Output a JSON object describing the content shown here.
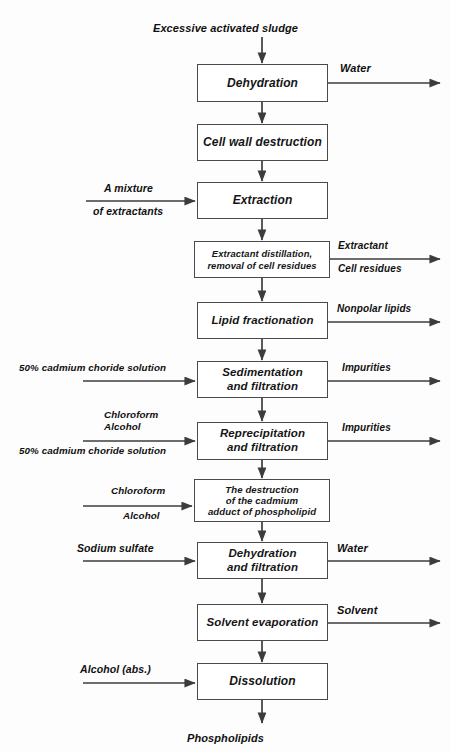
{
  "diagram": {
    "title_text": "Excessive activated sludge",
    "final_output": "Phospholipids",
    "line_color": "#3c3c3c",
    "box_border_color": "#4a4a4a",
    "text_color": "#101010",
    "background": "#fdfdfd"
  },
  "nodes": [
    {
      "id": "dehydration",
      "label": "Dehydration",
      "x": 197,
      "y": 64,
      "w": 131,
      "h": 38,
      "font": 12
    },
    {
      "id": "cell-wall",
      "label": "Cell wall destruction",
      "x": 197,
      "y": 124,
      "w": 131,
      "h": 37,
      "font": 12
    },
    {
      "id": "extraction",
      "label": "Extraction",
      "x": 197,
      "y": 182,
      "w": 131,
      "h": 37,
      "font": 12
    },
    {
      "id": "distillation",
      "label": "Extractant distillation,\nremoval of cell residues",
      "x": 194,
      "y": 241,
      "w": 136,
      "h": 37,
      "font": 9.4
    },
    {
      "id": "lipid-fraction",
      "label": "Lipid fractionation",
      "x": 197,
      "y": 302,
      "w": 131,
      "h": 37,
      "font": 11.5
    },
    {
      "id": "sedimentation",
      "label": "Sedimentation\nand filtration",
      "x": 197,
      "y": 361,
      "w": 131,
      "h": 37,
      "font": 11.5
    },
    {
      "id": "reprecipitation",
      "label": "Reprecipitation\nand filtration",
      "x": 197,
      "y": 422,
      "w": 131,
      "h": 38,
      "font": 11.5
    },
    {
      "id": "destruction",
      "label": "The destruction\nof the cadmium\nadduct of phospholipid",
      "x": 194,
      "y": 479,
      "w": 136,
      "h": 43,
      "font": 9.6
    },
    {
      "id": "dehydration-filt",
      "label": "Dehydration\nand filtration",
      "x": 197,
      "y": 542,
      "w": 131,
      "h": 37,
      "font": 11.5
    },
    {
      "id": "solvent-evap",
      "label": "Solvent evaporation",
      "x": 197,
      "y": 604,
      "w": 131,
      "h": 37,
      "font": 11.5
    },
    {
      "id": "dissolution",
      "label": "Dissolution",
      "x": 197,
      "y": 663,
      "w": 131,
      "h": 37,
      "font": 12
    }
  ],
  "inputs": [
    {
      "id": "mixture-extractants",
      "target": "extraction",
      "above": "A mixture",
      "below": "of extractants",
      "arrow_y": 201,
      "arrow_x1": 86,
      "arrow_x2": 195,
      "above_x": 104,
      "above_y": 182,
      "below_x": 93,
      "below_y": 205,
      "font": 10.5
    },
    {
      "id": "cadmium-chloride-1",
      "target": "sedimentation",
      "above": "50% cadmium choride solution",
      "below": "",
      "arrow_y": 381,
      "arrow_x1": 83,
      "arrow_x2": 195,
      "above_x": 19,
      "above_y": 362,
      "below_x": 0,
      "below_y": 0,
      "font": 9.8
    },
    {
      "id": "chloroform-alcohol-cadmium",
      "target": "reprecipitation",
      "above": "Chloroform\nAlcohol",
      "below": "50% cadmium choride solution",
      "arrow_y": 441,
      "arrow_x1": 83,
      "arrow_x2": 195,
      "above_x": 104,
      "above_y": 409,
      "below_x": 19,
      "below_y": 445,
      "font": 9.8
    },
    {
      "id": "chloroform-alcohol",
      "target": "destruction",
      "above": "Chloroform",
      "below": "Alcohol",
      "arrow_y": 506,
      "arrow_x1": 83,
      "arrow_x2": 192,
      "above_x": 111,
      "above_y": 485,
      "below_x": 123,
      "below_y": 510,
      "font": 9.8
    },
    {
      "id": "sodium-sulfate",
      "target": "dehydration-filt",
      "above": "Sodium sulfate",
      "below": "",
      "arrow_y": 561,
      "arrow_x1": 83,
      "arrow_x2": 195,
      "above_x": 77,
      "above_y": 542,
      "below_x": 0,
      "below_y": 0,
      "font": 10.5
    },
    {
      "id": "alcohol-abs",
      "target": "dissolution",
      "above": "Alcohol (abs.)",
      "below": "",
      "arrow_y": 683,
      "arrow_x1": 83,
      "arrow_x2": 195,
      "above_x": 80,
      "above_y": 663,
      "below_x": 0,
      "below_y": 0,
      "font": 10.5
    }
  ],
  "outputs": [
    {
      "id": "water-1",
      "source": "dehydration",
      "above": "Water",
      "below": "",
      "arrow_y": 83,
      "arrow_x1": 328,
      "arrow_x2": 440,
      "above_x": 340,
      "above_y": 62,
      "below_x": 0,
      "below_y": 0,
      "font": 11
    },
    {
      "id": "extractant-out",
      "source": "distillation",
      "above": "Extractant",
      "below": "Cell residues",
      "arrow_y": 259,
      "arrow_x1": 330,
      "arrow_x2": 440,
      "above_x": 338,
      "above_y": 240,
      "below_x": 338,
      "below_y": 263,
      "font": 10
    },
    {
      "id": "nonpolar-lipids",
      "source": "lipid-fraction",
      "above": "Nonpolar lipids",
      "below": "",
      "arrow_y": 322,
      "arrow_x1": 328,
      "arrow_x2": 440,
      "above_x": 337,
      "above_y": 303,
      "below_x": 0,
      "below_y": 0,
      "font": 10
    },
    {
      "id": "impurities-1",
      "source": "sedimentation",
      "above": "Impurities",
      "below": "",
      "arrow_y": 381,
      "arrow_x1": 328,
      "arrow_x2": 440,
      "above_x": 342,
      "above_y": 362,
      "below_x": 0,
      "below_y": 0,
      "font": 10
    },
    {
      "id": "impurities-2",
      "source": "reprecipitation",
      "above": "Impurities",
      "below": "",
      "arrow_y": 441,
      "arrow_x1": 328,
      "arrow_x2": 440,
      "above_x": 342,
      "above_y": 422,
      "below_x": 0,
      "below_y": 0,
      "font": 10
    },
    {
      "id": "water-2",
      "source": "dehydration-filt",
      "above": "Water",
      "below": "",
      "arrow_y": 561,
      "arrow_x1": 328,
      "arrow_x2": 440,
      "above_x": 337,
      "above_y": 542,
      "below_x": 0,
      "below_y": 0,
      "font": 11
    },
    {
      "id": "solvent-out",
      "source": "solvent-evap",
      "above": "Solvent",
      "below": "",
      "arrow_y": 623,
      "arrow_x1": 328,
      "arrow_x2": 440,
      "above_x": 337,
      "above_y": 604,
      "below_x": 0,
      "below_y": 0,
      "font": 11
    }
  ],
  "entry": {
    "label": "Excessive activated sludge",
    "label_x": 262,
    "label_y": 22,
    "font": 11,
    "arrow_x": 262,
    "arrow_y1": 37,
    "arrow_y2": 63
  },
  "exit": {
    "label": "Phospholipids",
    "label_x": 262,
    "label_y": 732,
    "font": 11,
    "arrow_x": 262,
    "arrow_y1": 700,
    "arrow_y2": 723
  },
  "vertical_links": [
    {
      "id": "dehydration-to-cell-wall",
      "x": 262,
      "y1": 102,
      "y2": 123
    },
    {
      "id": "cell-wall-to-extraction",
      "x": 262,
      "y1": 161,
      "y2": 181
    },
    {
      "id": "extraction-to-distillation",
      "x": 262,
      "y1": 219,
      "y2": 240
    },
    {
      "id": "distillation-to-lipid",
      "x": 262,
      "y1": 278,
      "y2": 301
    },
    {
      "id": "lipid-to-sedimentation",
      "x": 262,
      "y1": 339,
      "y2": 360
    },
    {
      "id": "sedimentation-to-reprecip",
      "x": 262,
      "y1": 398,
      "y2": 421
    },
    {
      "id": "reprecip-to-destruction",
      "x": 262,
      "y1": 460,
      "y2": 478
    },
    {
      "id": "destruction-to-dehydration",
      "x": 262,
      "y1": 522,
      "y2": 541
    },
    {
      "id": "dehydration-to-solvent",
      "x": 262,
      "y1": 579,
      "y2": 603
    },
    {
      "id": "solvent-to-dissolution",
      "x": 262,
      "y1": 641,
      "y2": 662
    }
  ],
  "chart_data": {
    "type": "diagram",
    "process_steps": [
      "Dehydration",
      "Cell wall destruction",
      "Extraction",
      "Extractant distillation, removal of cell residues",
      "Lipid fractionation",
      "Sedimentation and filtration",
      "Reprecipitation and filtration",
      "The destruction of the cadmium adduct of phospholipid",
      "Dehydration and filtration",
      "Solvent evaporation",
      "Dissolution"
    ],
    "feed": "Excessive activated sludge",
    "product": "Phospholipids",
    "side_inputs": [
      "A mixture of extractants",
      "50% cadmium choride solution",
      "Chloroform / Alcohol / 50% cadmium choride solution",
      "Chloroform / Alcohol",
      "Sodium sulfate",
      "Alcohol (abs.)"
    ],
    "side_outputs": [
      "Water",
      "Extractant / Cell residues",
      "Nonpolar lipids",
      "Impurities",
      "Impurities",
      "Water",
      "Solvent"
    ]
  }
}
